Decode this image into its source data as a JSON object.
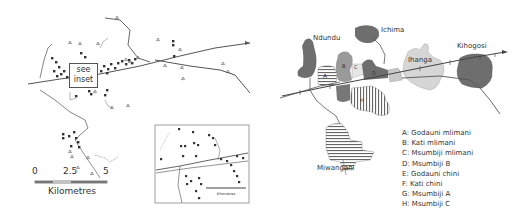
{
  "left_map": {
    "inset_note": {
      "line1": "see",
      "line2": "inset"
    },
    "scale_bar": {
      "ticks": [
        "0",
        "2.5",
        "5"
      ],
      "unit": "Kilometres"
    },
    "inset": {
      "scale_unit": "Kilometres",
      "scale_tick": "0.5"
    }
  },
  "right_map": {
    "places": {
      "ndundu": "Ndundu",
      "ichima": "Ichima",
      "kihogosi": "Kihogosi",
      "ihanga": "Ihanga",
      "miwangani": "Miwangani"
    },
    "zone_letters": [
      "A",
      "B",
      "C",
      "D",
      "E",
      "F",
      "G",
      "H"
    ],
    "legend": [
      "A: Godauni mlimani",
      "B: Kati mlimani",
      "C: Msumbiji mlimani",
      "D: Msumbiji B",
      "E: Godauni chini",
      "F: Kati chini",
      "G: Msumbiji A",
      "H: Msumbiji C"
    ]
  },
  "colors": {
    "dark_zone": "#6e6e6e",
    "mid_zone": "#9a9a9a",
    "light_zone": "#d6d6d6",
    "line": "#555555"
  }
}
